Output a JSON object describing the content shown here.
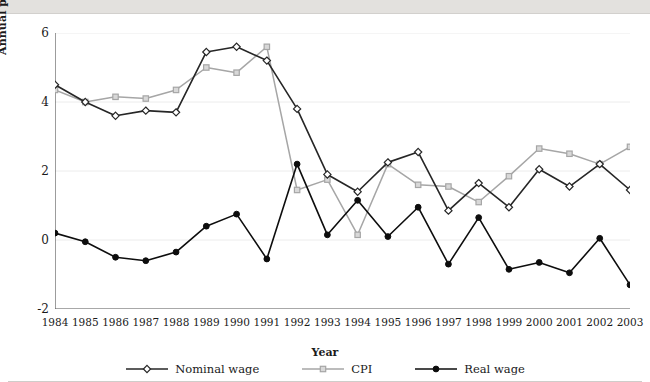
{
  "topband": {
    "cut_title": ""
  },
  "chart_data": {
    "type": "line",
    "title": "",
    "xlabel": "Year",
    "ylabel": "Annual percentage change",
    "xlim": [
      1984,
      2003
    ],
    "ylim": [
      -2,
      6
    ],
    "yticks": [
      -2,
      0,
      2,
      4,
      6
    ],
    "ytick_labels": [
      "-2",
      "0",
      "2",
      "4",
      "6"
    ],
    "grid": true,
    "grid_axis": "y",
    "legend_position": "bottom",
    "categories": [
      1984,
      1985,
      1986,
      1987,
      1988,
      1989,
      1990,
      1991,
      1992,
      1993,
      1994,
      1995,
      1996,
      1997,
      1998,
      1999,
      2000,
      2001,
      2002,
      2003
    ],
    "xtick_labels": [
      "1984",
      "1985",
      "1986",
      "1987",
      "1988",
      "1989",
      "1990",
      "1991",
      "1992",
      "1993",
      "1994",
      "1995",
      "1996",
      "1997",
      "1998",
      "1999",
      "2000",
      "2001",
      "2002",
      "2003"
    ],
    "series": [
      {
        "name": "Nominal wage",
        "color": "#262626",
        "marker": "open-diamond",
        "values": [
          4.5,
          4.0,
          3.6,
          3.75,
          3.7,
          5.45,
          5.6,
          5.2,
          3.8,
          1.9,
          1.4,
          2.25,
          2.55,
          0.85,
          1.65,
          0.95,
          2.05,
          1.55,
          2.2,
          1.45
        ]
      },
      {
        "name": "CPI",
        "color": "#a6a6a6",
        "marker": "open-square",
        "values": [
          4.35,
          4.0,
          4.15,
          4.1,
          4.35,
          5.0,
          4.85,
          5.6,
          1.45,
          1.75,
          0.15,
          2.2,
          1.6,
          1.55,
          1.1,
          1.85,
          2.65,
          2.5,
          2.2,
          2.7
        ]
      },
      {
        "name": "Real wage",
        "color": "#0d0d0d",
        "marker": "filled-circle",
        "values": [
          0.2,
          -0.05,
          -0.5,
          -0.6,
          -0.35,
          0.4,
          0.75,
          -0.55,
          2.2,
          0.15,
          1.15,
          0.1,
          0.95,
          -0.7,
          0.65,
          -0.85,
          -0.65,
          -0.95,
          0.05,
          -1.3
        ]
      }
    ]
  },
  "legend": {
    "items": [
      {
        "label": "Nominal wage",
        "icon": "open-diamond-line-icon"
      },
      {
        "label": "CPI",
        "icon": "open-square-line-icon"
      },
      {
        "label": "Real wage",
        "icon": "filled-circle-line-icon"
      }
    ]
  }
}
